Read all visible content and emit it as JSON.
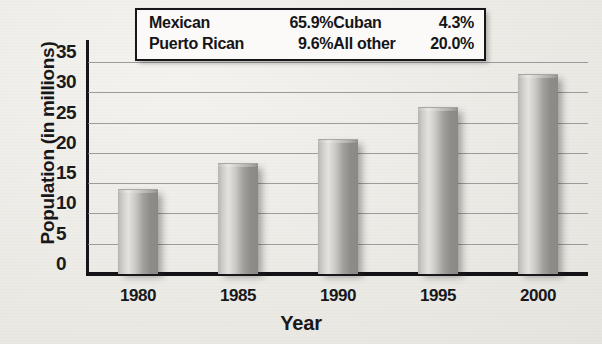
{
  "chart_data": {
    "type": "bar",
    "title": "",
    "xlabel": "Year",
    "ylabel": "Population (in millions)",
    "categories": [
      "1980",
      "1985",
      "1990",
      "1995",
      "2000"
    ],
    "values": [
      13.8,
      18.2,
      22.2,
      27.4,
      32.9
    ],
    "ylim": [
      0,
      37
    ],
    "yticks": [
      "0",
      "5",
      "10",
      "15",
      "20",
      "25",
      "30",
      "35"
    ],
    "ytick_values": [
      0,
      5,
      10,
      15,
      20,
      25,
      30,
      35
    ],
    "grid": true,
    "legend_position": "top-center",
    "annotations": {
      "legend_title": "",
      "legend_entries": [
        {
          "label": "Mexican",
          "value": "65.9%"
        },
        {
          "label": "Cuban",
          "value": "4.3%"
        },
        {
          "label": "Puerto Rican",
          "value": "9.6%"
        },
        {
          "label": "All other",
          "value": "20.0%"
        }
      ]
    }
  },
  "colors": {
    "bar_light": "#e3e2df",
    "bar_dark": "#8a8985",
    "axis": "#141418",
    "gridline": "#8d8d8d",
    "background": "#eceae5",
    "legend_background": "#fbfaf8",
    "text": "#18181a"
  }
}
